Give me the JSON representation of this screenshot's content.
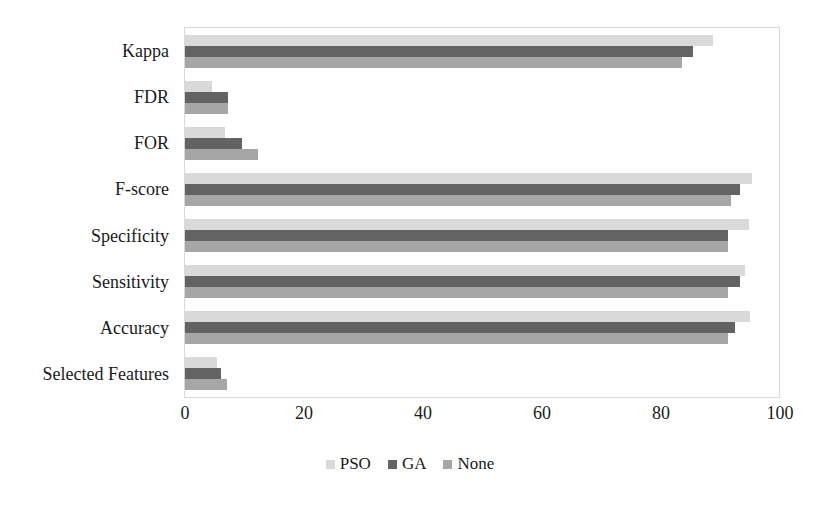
{
  "chart_data": {
    "type": "bar",
    "orientation": "horizontal",
    "title": "",
    "xlabel": "",
    "ylabel": "",
    "xlim": [
      0,
      100
    ],
    "xticks": [
      0,
      20,
      40,
      60,
      80,
      100
    ],
    "xtick_labels": [
      "0",
      "20",
      "40",
      "60",
      "80",
      "100"
    ],
    "grid": false,
    "legend_position": "bottom",
    "categories": [
      "Kappa",
      "FDR",
      "FOR",
      "F-score",
      "Specificity",
      "Sensitivity",
      "Accuracy",
      "Selected Features"
    ],
    "series": [
      {
        "name": "PSO",
        "color": "#d9d9d9",
        "values": [
          88.8,
          4.5,
          6.8,
          95.3,
          94.8,
          94.2,
          95.0,
          5.4
        ]
      },
      {
        "name": "GA",
        "color": "#636363",
        "values": [
          85.3,
          7.3,
          9.5,
          93.2,
          91.3,
          93.2,
          92.5,
          6.0
        ]
      },
      {
        "name": "None",
        "color": "#a6a6a6",
        "values": [
          83.6,
          7.3,
          12.2,
          91.7,
          91.3,
          91.2,
          91.2,
          7.0
        ]
      }
    ]
  },
  "legend": {
    "items": [
      {
        "label": "PSO",
        "color": "#d9d9d9"
      },
      {
        "label": "GA",
        "color": "#636363"
      },
      {
        "label": "None",
        "color": "#a6a6a6"
      }
    ]
  },
  "colors": {
    "plot_border": "#d8d8d8",
    "background": "#ffffff",
    "text": "#1a1a1a"
  }
}
